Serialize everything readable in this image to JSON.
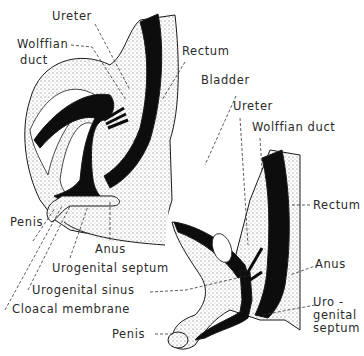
{
  "figure": {
    "colors": {
      "lumen": "#0d0d0d",
      "tissue_stipple": "#bdbdbd",
      "outline": "#1a1a1a",
      "background": "#ffffff",
      "label_text": "#2a2a2a"
    },
    "upper_diagram": {
      "labels": {
        "ureter": "Ureter",
        "wolffian_duct_line1": "Wolffian",
        "wolffian_duct_line2": "duct",
        "rectum": "Rectum",
        "penis": "Penis",
        "anus": "Anus",
        "urogenital_septum": "Urogenital septum",
        "urogenital_sinus": "Urogenital sinus",
        "cloacal_membrane": "Cloacal membrane"
      }
    },
    "lower_diagram": {
      "labels": {
        "bladder": "Bladder",
        "ureter": "Ureter",
        "wolffian_duct": "Wolffian duct",
        "rectum": "Rectum",
        "anus": "Anus",
        "urogenital_septum_line1": "Uro -",
        "urogenital_septum_line2": "genital",
        "urogenital_septum_line3": "septum",
        "penis": "Penis"
      }
    }
  }
}
